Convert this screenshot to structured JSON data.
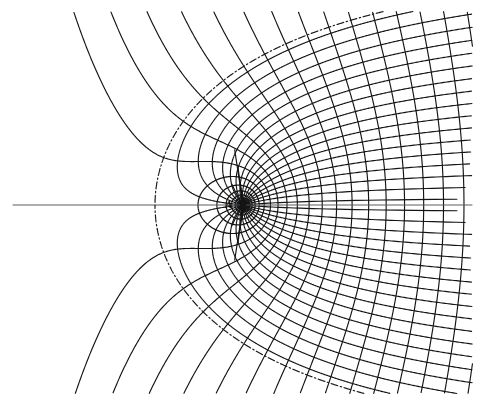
{
  "figure": {
    "kind": "flow-net",
    "width": 489,
    "height": 407,
    "background_color": "#ffffff",
    "line_color": "#141414",
    "axis_color": "#555555",
    "dash_color": "#1a1a1a"
  },
  "labels": [
    {
      "id": "source-point-label",
      "text": "A",
      "x": 225,
      "y": 199,
      "style": "italic"
    }
  ],
  "chart_data": {
    "type": "line",
    "title": "",
    "xlabel": "",
    "ylabel": "",
    "plot_box": {
      "x0": 13,
      "y0": 12,
      "x1": 472,
      "y1": 393
    },
    "singularity": {
      "name": "source",
      "label": "A",
      "px": 243,
      "py": 205,
      "marker": "filled-blob",
      "marker_radius": 4.0
    },
    "stagnation_point": {
      "name": "saddle",
      "px": 155,
      "py": 205,
      "marker": "none"
    },
    "axis_of_symmetry": {
      "orientation": "horizontal",
      "py": 205,
      "x_from": 13,
      "x_to": 472
    },
    "model": {
      "potential": "w = U*z + m*ln(z)",
      "U": 1.0,
      "m": 88.0,
      "units": "pixels",
      "note": "z measured from source A; stagnation at z = -m/U"
    },
    "families": [
      {
        "name": "streamlines",
        "line_style": "solid",
        "stroke_width": 1.15,
        "count": 34,
        "psi_values": [
          -16.5,
          -15.5,
          -14.5,
          -13.5,
          -12.5,
          -11.5,
          -10.5,
          -9.5,
          -8.5,
          -7.5,
          -6.5,
          -5.5,
          -4.5,
          -3.5,
          -2.5,
          -1.5,
          -0.5,
          0.5,
          1.5,
          2.5,
          3.5,
          4.5,
          5.5,
          6.5,
          7.5,
          8.5,
          9.5,
          10.5,
          11.5,
          12.5,
          13.5,
          14.5,
          15.5,
          16.5
        ]
      },
      {
        "name": "equipotentials",
        "line_style": "solid",
        "stroke_width": 1.15,
        "count": 40,
        "phi_spacing": 29
      },
      {
        "name": "separatrix",
        "line_style": "dash-dot",
        "stroke_width": 1.2,
        "psi_value": 0,
        "note": "dividing streamline through the stagnation point; body surface of the half-body"
      }
    ]
  }
}
